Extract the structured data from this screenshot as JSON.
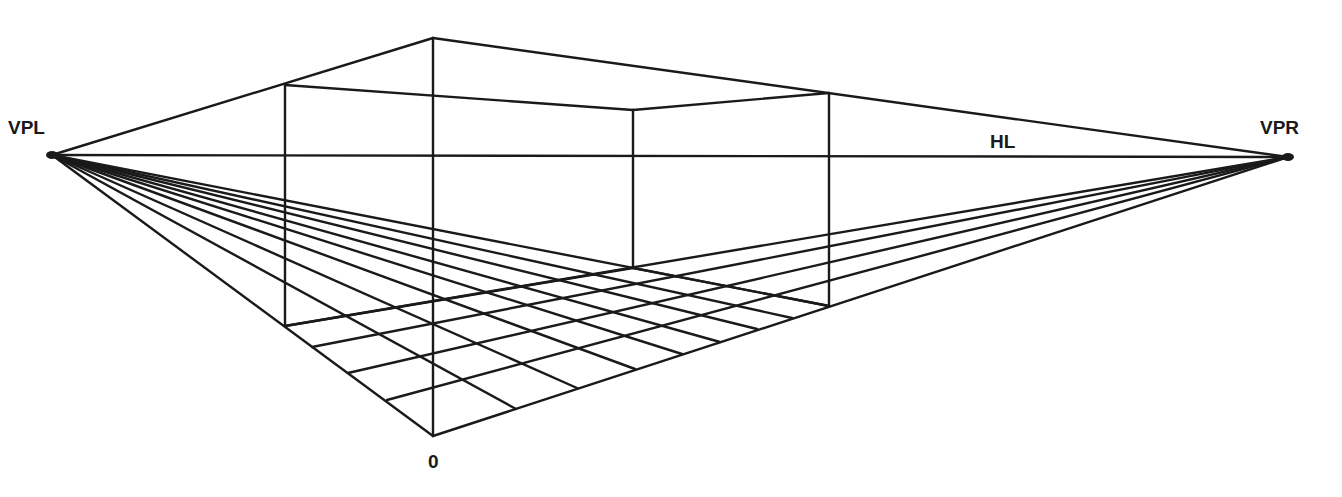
{
  "diagram": {
    "stroke_color": "#1a1a1a",
    "background": "#ffffff",
    "labels": {
      "vpl": "VPL",
      "vpr": "VPR",
      "hl": "HL",
      "origin": "0"
    },
    "points": {
      "VPL": [
        52,
        155
      ],
      "VPR": [
        1288,
        157
      ],
      "O": [
        433,
        436
      ],
      "front_top": [
        433,
        38
      ],
      "left_bottom": [
        285,
        326
      ],
      "left_top": [
        285,
        85
      ],
      "right_bottom": [
        829,
        306
      ],
      "right_top": [
        829,
        93
      ],
      "back_bottom": [
        633,
        268
      ],
      "back_top": [
        633,
        110
      ]
    },
    "floor_grid": {
      "right_edge_points": [
        [
          516,
          409
        ],
        [
          577,
          388
        ],
        [
          635,
          369
        ],
        [
          682,
          354
        ],
        [
          720,
          342
        ],
        [
          757,
          329
        ],
        [
          792,
          318
        ]
      ],
      "left_edge_points": [
        [
          387,
          400
        ],
        [
          348,
          373
        ],
        [
          312,
          347
        ]
      ]
    }
  }
}
